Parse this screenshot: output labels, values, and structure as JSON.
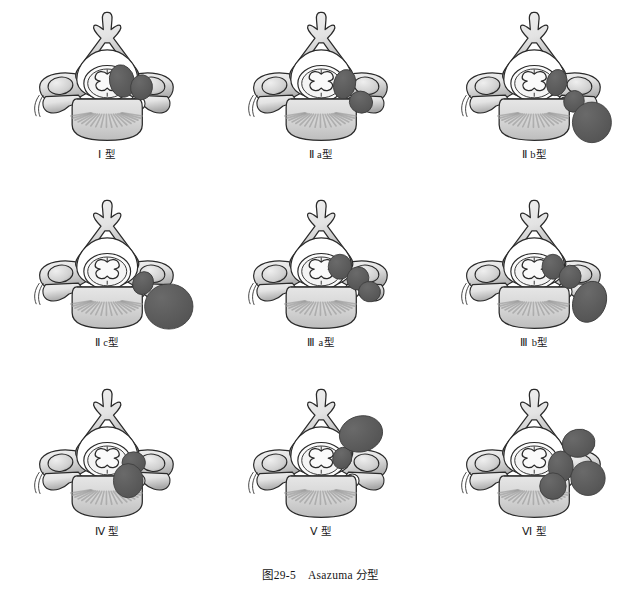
{
  "figure": {
    "caption_number": "图29-5",
    "caption_title": "Asazuma 分型",
    "background_color": "#ffffff"
  },
  "palette": {
    "bone_light": "#e3e3e3",
    "bone_mid": "#c9c9c9",
    "bone_shadow": "#a8a8a8",
    "body_fill": "#d4d4d4",
    "cord_fill": "#f2f2f2",
    "tumor_fill": "#5c5c5c",
    "outline": "#2a2a2a",
    "label_color": "#1b1b1b"
  },
  "panels": [
    {
      "id": "type-1",
      "label": "Ⅰ 型",
      "tumor_description": "intradural intraspinal mass compressing cord, no foraminal extension",
      "tumor_shapes": [
        {
          "kind": "ellipse",
          "cx": 120,
          "cy": 104,
          "rx": 16,
          "ry": 21,
          "rot": -12
        },
        {
          "kind": "ellipse",
          "cx": 145,
          "cy": 112,
          "rx": 14,
          "ry": 16,
          "rot": 8
        }
      ]
    },
    {
      "id": "type-2a",
      "label": "Ⅱ a型",
      "tumor_description": "intraspinal component extending into the intervertebral foramen",
      "tumor_shapes": [
        {
          "kind": "ellipse",
          "cx": 131,
          "cy": 108,
          "rx": 14,
          "ry": 19,
          "rot": 14
        },
        {
          "kind": "ellipse",
          "cx": 152,
          "cy": 131,
          "rx": 15,
          "ry": 14,
          "rot": 20
        }
      ]
    },
    {
      "id": "type-2b",
      "label": "Ⅱ b型",
      "tumor_description": "foraminal tumor with large extraforaminal dumbbell lobe",
      "tumor_shapes": [
        {
          "kind": "ellipse",
          "cx": 130,
          "cy": 106,
          "rx": 13,
          "ry": 17,
          "rot": 12
        },
        {
          "kind": "ellipse",
          "cx": 152,
          "cy": 130,
          "rx": 13,
          "ry": 14,
          "rot": 25
        },
        {
          "kind": "ellipse",
          "cx": 175,
          "cy": 157,
          "rx": 25,
          "ry": 26,
          "rot": 0
        }
      ]
    },
    {
      "id": "type-2c",
      "label": "Ⅱ c型",
      "tumor_description": "predominantly extraforaminal paravertebral mass with narrow neck",
      "tumor_shapes": [
        {
          "kind": "ellipse",
          "cx": 147,
          "cy": 122,
          "rx": 13,
          "ry": 15,
          "rot": 25
        },
        {
          "kind": "ellipse",
          "cx": 180,
          "cy": 152,
          "rx": 31,
          "ry": 29,
          "rot": 0
        }
      ]
    },
    {
      "id": "type-3a",
      "label": "Ⅲ a型",
      "tumor_description": "intradural plus foraminal plus small extraforaminal components",
      "tumor_shapes": [
        {
          "kind": "ellipse",
          "cx": 125,
          "cy": 101,
          "rx": 15,
          "ry": 16,
          "rot": 0
        },
        {
          "kind": "ellipse",
          "cx": 148,
          "cy": 116,
          "rx": 14,
          "ry": 15,
          "rot": 18
        },
        {
          "kind": "ellipse",
          "cx": 163,
          "cy": 133,
          "rx": 14,
          "ry": 13,
          "rot": 10
        }
      ]
    },
    {
      "id": "type-3b",
      "label": "Ⅲ b型",
      "tumor_description": "intradural, foraminal and large extraforaminal three-part dumbbell",
      "tumor_shapes": [
        {
          "kind": "ellipse",
          "cx": 125,
          "cy": 101,
          "rx": 14,
          "ry": 16,
          "rot": 0
        },
        {
          "kind": "ellipse",
          "cx": 147,
          "cy": 114,
          "rx": 14,
          "ry": 15,
          "rot": 18
        },
        {
          "kind": "ellipse",
          "cx": 172,
          "cy": 146,
          "rx": 21,
          "ry": 27,
          "rot": 22
        }
      ]
    },
    {
      "id": "type-4",
      "label": "Ⅳ 型",
      "tumor_description": "tumor eroding and invading the vertebral body",
      "tumor_shapes": [
        {
          "kind": "ellipse",
          "cx": 135,
          "cy": 110,
          "rx": 15,
          "ry": 14,
          "rot": 0
        },
        {
          "kind": "ellipse",
          "cx": 128,
          "cy": 133,
          "rx": 19,
          "ry": 22,
          "rot": 0
        }
      ]
    },
    {
      "id": "type-5",
      "label": "Ⅴ 型",
      "tumor_description": "tumor extending posteriorly through the lamina into paraspinal muscles",
      "tumor_shapes": [
        {
          "kind": "ellipse",
          "cx": 128,
          "cy": 104,
          "rx": 12,
          "ry": 14,
          "rot": 20
        },
        {
          "kind": "ellipse",
          "cx": 152,
          "cy": 73,
          "rx": 28,
          "ry": 23,
          "rot": -15
        }
      ]
    },
    {
      "id": "type-6",
      "label": "Ⅵ 型",
      "tumor_description": "multidirectional multilobular tumor with three separate lobes",
      "tumor_shapes": [
        {
          "kind": "ellipse",
          "cx": 135,
          "cy": 115,
          "rx": 16,
          "ry": 20,
          "rot": 0
        },
        {
          "kind": "ellipse",
          "cx": 158,
          "cy": 85,
          "rx": 21,
          "ry": 18,
          "rot": -10
        },
        {
          "kind": "ellipse",
          "cx": 170,
          "cy": 130,
          "rx": 22,
          "ry": 22,
          "rot": 0
        },
        {
          "kind": "ellipse",
          "cx": 125,
          "cy": 140,
          "rx": 17,
          "ry": 17,
          "rot": 0
        }
      ]
    }
  ]
}
